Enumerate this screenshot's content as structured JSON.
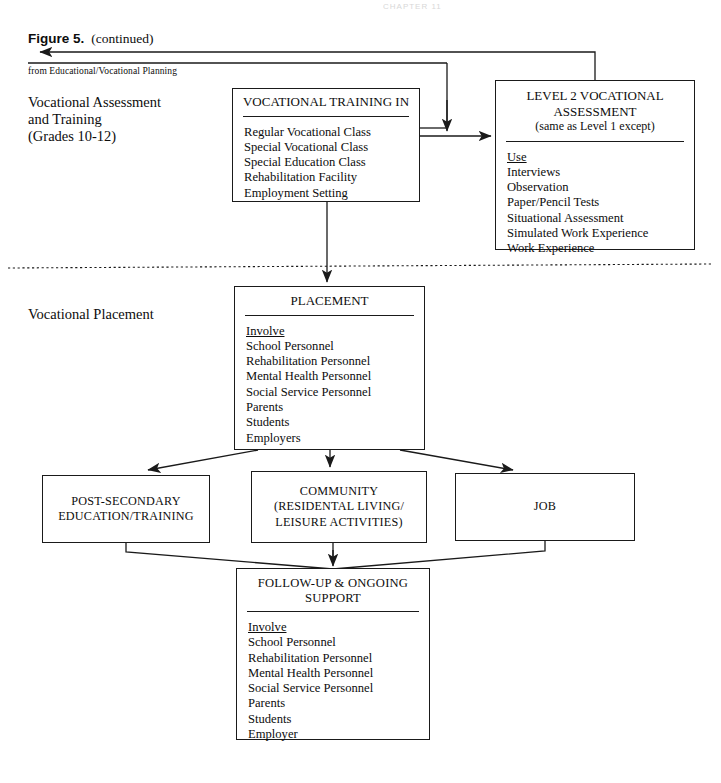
{
  "figure": {
    "label": "Figure 5.",
    "continued": "(continued)",
    "from_note": "from Educational/Vocational Planning",
    "page_header_faint": "CHAPTER 11"
  },
  "stage_labels": {
    "assessment": "Vocational Assessment\nand Training\n(Grades 10-12)",
    "assessment_lines": [
      "Vocational Assessment",
      "and Training",
      "(Grades 10-12)"
    ],
    "placement": "Vocational Placement"
  },
  "boxes": {
    "training": {
      "title": "VOCATIONAL TRAINING IN",
      "items": [
        "Regular Vocational Class",
        "Special Vocational Class",
        "Special Education Class",
        "Rehabilitation Facility",
        "Employment Setting"
      ]
    },
    "level2": {
      "title_line1": "LEVEL 2 VOCATIONAL",
      "title_line2": "ASSESSMENT",
      "title_line3": "(same as Level 1 except)",
      "list_header": "Use",
      "items": [
        "Interviews",
        "Observation",
        "Paper/Pencil Tests",
        "Situational Assessment",
        "Simulated Work Experience",
        "Work Experience"
      ]
    },
    "placement": {
      "title": "PLACEMENT",
      "list_header": "Involve",
      "items": [
        "School Personnel",
        "Rehabilitation Personnel",
        "Mental Health Personnel",
        "Social Service Personnel",
        "Parents",
        "Students",
        "Employers"
      ]
    },
    "post_secondary": {
      "line1": "POST-SECONDARY",
      "line2": "EDUCATION/TRAINING"
    },
    "community": {
      "line1": "COMMUNITY",
      "line2": "(RESIDENTAL LIVING/",
      "line3": "LEISURE ACTIVITIES)"
    },
    "job": {
      "line1": "JOB"
    },
    "followup": {
      "title_line1": "FOLLOW-UP & ONGOING",
      "title_line2": "SUPPORT",
      "list_header": "Involve",
      "items": [
        "School Personnel",
        "Rehabilitation Personnel",
        "Mental Health Personnel",
        "Social Service Personnel",
        "Parents",
        "Students",
        "Employer"
      ]
    }
  },
  "colors": {
    "ink": "#1a1a1a",
    "paper": "#ffffff"
  }
}
